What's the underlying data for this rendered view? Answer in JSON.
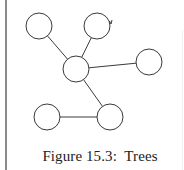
{
  "figure": {
    "caption": "Figure 15.3:  Trees",
    "stroke_color": "#3a3a3a",
    "fill_color": "#ffffff",
    "rule_color": "#8a8a8a"
  },
  "graph": {
    "type": "tree",
    "nodes": [
      {
        "id": "n1",
        "cx": 39,
        "cy": 26,
        "r": 13
      },
      {
        "id": "n2",
        "cx": 97,
        "cy": 26,
        "r": 13
      },
      {
        "id": "n3",
        "cx": 76,
        "cy": 69,
        "r": 13
      },
      {
        "id": "n4",
        "cx": 149,
        "cy": 62,
        "r": 13
      },
      {
        "id": "n5",
        "cx": 47,
        "cy": 117,
        "r": 13
      },
      {
        "id": "n6",
        "cx": 110,
        "cy": 117,
        "r": 13
      }
    ],
    "edges": [
      {
        "from": "n1",
        "to": "n3"
      },
      {
        "from": "n2",
        "to": "n3"
      },
      {
        "from": "n3",
        "to": "n4"
      },
      {
        "from": "n3",
        "to": "n6"
      },
      {
        "from": "n5",
        "to": "n6"
      }
    ]
  }
}
